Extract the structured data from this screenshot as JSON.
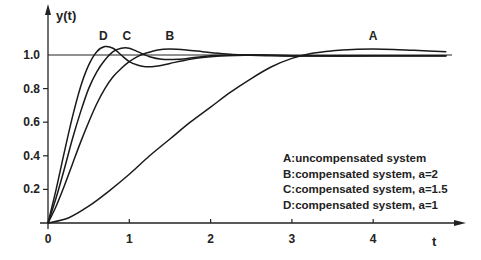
{
  "chart_data": {
    "type": "line",
    "title": "",
    "xlabel": "t",
    "ylabel": "y(t)",
    "xlim": [
      0,
      5
    ],
    "ylim": [
      0,
      1.15
    ],
    "x_ticks": [
      "0",
      "1",
      "2",
      "3",
      "4"
    ],
    "y_ticks": [
      "0.2",
      "0.4",
      "0.6",
      "0.8",
      "1.0"
    ],
    "reference_line": {
      "y": 1.0
    },
    "grid": false,
    "legend_position": "lower right",
    "legend": [
      "A:uncompensated system",
      "B:compensated system, a=2",
      "C:compensated system, a=1.5",
      "D:compensated system, a=1"
    ],
    "series": [
      {
        "name": "A",
        "label": "A:uncompensated system",
        "x": [
          0,
          0.25,
          0.5,
          0.75,
          1.0,
          1.25,
          1.5,
          1.75,
          2.0,
          2.25,
          2.5,
          2.75,
          3.0,
          3.25,
          3.5,
          3.75,
          4.0,
          4.25,
          4.5,
          4.9
        ],
        "y": [
          0,
          0.03,
          0.1,
          0.19,
          0.29,
          0.4,
          0.5,
          0.6,
          0.69,
          0.78,
          0.86,
          0.93,
          0.98,
          1.01,
          1.025,
          1.033,
          1.035,
          1.033,
          1.028,
          1.02
        ]
      },
      {
        "name": "B",
        "label": "B:compensated system, a=2",
        "x": [
          0,
          0.1,
          0.2,
          0.3,
          0.4,
          0.5,
          0.6,
          0.7,
          0.8,
          0.9,
          1.0,
          1.1,
          1.2,
          1.35,
          1.5,
          1.7,
          1.9,
          2.1,
          2.4,
          2.8,
          3.2,
          4.0,
          4.9
        ],
        "y": [
          0,
          0.1,
          0.22,
          0.35,
          0.48,
          0.6,
          0.71,
          0.8,
          0.87,
          0.92,
          0.96,
          0.99,
          1.01,
          1.03,
          1.035,
          1.03,
          1.02,
          1.01,
          1.0,
          0.995,
          0.995,
          0.995,
          0.995
        ]
      },
      {
        "name": "C",
        "label": "C:compensated system, a=1.5",
        "x": [
          0,
          0.1,
          0.2,
          0.3,
          0.4,
          0.5,
          0.6,
          0.7,
          0.8,
          0.9,
          1.0,
          1.1,
          1.25,
          1.4,
          1.6,
          1.8,
          2.0,
          2.3,
          2.6,
          3.0,
          4.0,
          4.9
        ],
        "y": [
          0,
          0.15,
          0.32,
          0.5,
          0.66,
          0.8,
          0.9,
          0.97,
          1.02,
          1.04,
          1.04,
          1.02,
          0.99,
          0.975,
          0.975,
          0.985,
          0.995,
          1.0,
          1.0,
          0.995,
          0.995,
          0.995
        ]
      },
      {
        "name": "D",
        "label": "D:compensated system, a=1",
        "x": [
          0,
          0.1,
          0.2,
          0.3,
          0.4,
          0.5,
          0.6,
          0.7,
          0.8,
          0.9,
          1.0,
          1.1,
          1.2,
          1.35,
          1.5,
          1.7,
          1.9,
          2.2,
          2.6,
          3.0,
          4.0,
          4.9
        ],
        "y": [
          0,
          0.2,
          0.42,
          0.63,
          0.81,
          0.94,
          1.02,
          1.05,
          1.04,
          1.0,
          0.96,
          0.94,
          0.93,
          0.935,
          0.95,
          0.97,
          0.985,
          0.995,
          1.0,
          0.995,
          0.995,
          0.995
        ]
      }
    ],
    "curve_labels": [
      {
        "text": "A",
        "x": 4.0,
        "y": 1.1
      },
      {
        "text": "B",
        "x": 1.5,
        "y": 1.1
      },
      {
        "text": "C",
        "x": 0.97,
        "y": 1.1
      },
      {
        "text": "D",
        "x": 0.68,
        "y": 1.1
      }
    ]
  }
}
